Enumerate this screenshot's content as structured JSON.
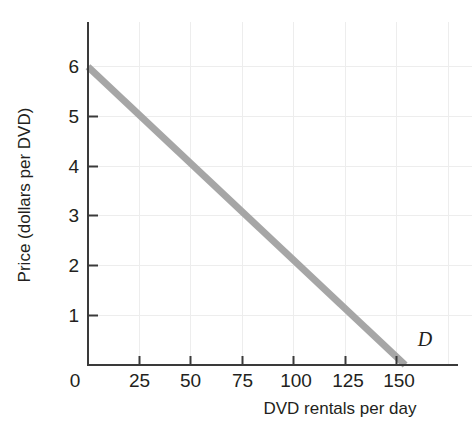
{
  "chart_data": {
    "type": "line",
    "title": "",
    "subtitle": "",
    "xlabel": "DVD rentals per day",
    "ylabel": "Price (dollars per DVD)",
    "xlim": [
      0,
      175
    ],
    "ylim": [
      0,
      6.9
    ],
    "xticks": [
      0,
      25,
      50,
      75,
      100,
      125,
      150
    ],
    "xticklabels": [
      "0",
      "25",
      "50",
      "75",
      "100",
      "125",
      "150"
    ],
    "yticks": [
      0,
      1,
      2,
      3,
      4,
      5,
      6
    ],
    "yticklabels": [
      "0",
      "1",
      "2",
      "3",
      "4",
      "5",
      "6"
    ],
    "grid": true,
    "grid_color": "#ededed",
    "legend": "none",
    "series": [
      {
        "name": "D",
        "label": "D",
        "label_style": "italic",
        "color": "#a6a6a6",
        "linewidth": 7,
        "x": [
          0,
          25,
          50,
          75,
          100,
          125,
          150
        ],
        "y": [
          6,
          5,
          4,
          3,
          2,
          1,
          0
        ],
        "annotation": "D",
        "annotation_x": 156,
        "annotation_y": 0.38
      }
    ],
    "axis_color": "#3a3a3a",
    "text_color": "#231f20"
  },
  "labels": {
    "y_axis_title": "Price (dollars per DVD)",
    "x_axis_title": "DVD rentals per day",
    "demand_curve": "D",
    "x_tick_0": "0",
    "x_tick_25": "25",
    "x_tick_50": "50",
    "x_tick_75": "75",
    "x_tick_100": "100",
    "x_tick_125": "125",
    "x_tick_150": "150",
    "y_tick_1": "1",
    "y_tick_2": "2",
    "y_tick_3": "3",
    "y_tick_4": "4",
    "y_tick_5": "5",
    "y_tick_6": "6"
  }
}
